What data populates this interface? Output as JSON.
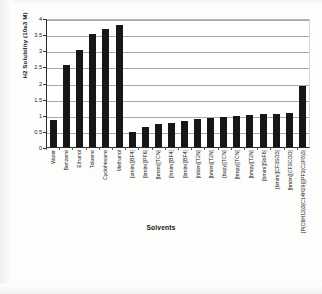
{
  "chart_data": {
    "type": "bar",
    "title": "",
    "xlabel": "Solvents",
    "ylabel": "H2 Solubility (10e3 M)",
    "ylim": [
      0,
      4
    ],
    "yticks": [
      0,
      0.5,
      1,
      1.5,
      2,
      2.5,
      3,
      3.5,
      4
    ],
    "ytick_labels": [
      "0",
      "0.5",
      "1",
      "1.5",
      "2",
      "2.5",
      "3",
      "3.5",
      "4"
    ],
    "grid": true,
    "legend": "none",
    "bar_color": "#171717",
    "categories": [
      "Water",
      "Benzene",
      "Ethanol",
      "Toluene",
      "Cyclohexane",
      "Methanol",
      "[omim][BF4]",
      "[bmim][PF6]",
      "[bmim][TCN]",
      "[hmim][BF4]",
      "[bmim][BF4]",
      "[mbim][T2N]",
      "[bmim][T2N]",
      "[bupy][TCN]",
      "[bmpy][TCN]",
      "[bmpy][T2N]",
      "[bmim][SbF6]",
      "[bmim][CF3SO3]",
      "[bmim][CF3COO]",
      "[P(C6H13)3(C14H29)][PF3(C2F5)3]"
    ],
    "values": [
      0.85,
      2.55,
      3.0,
      3.5,
      3.65,
      3.77,
      0.46,
      0.62,
      0.72,
      0.74,
      0.82,
      0.86,
      0.9,
      0.92,
      0.95,
      1.0,
      1.02,
      1.02,
      1.05,
      1.9
    ]
  }
}
